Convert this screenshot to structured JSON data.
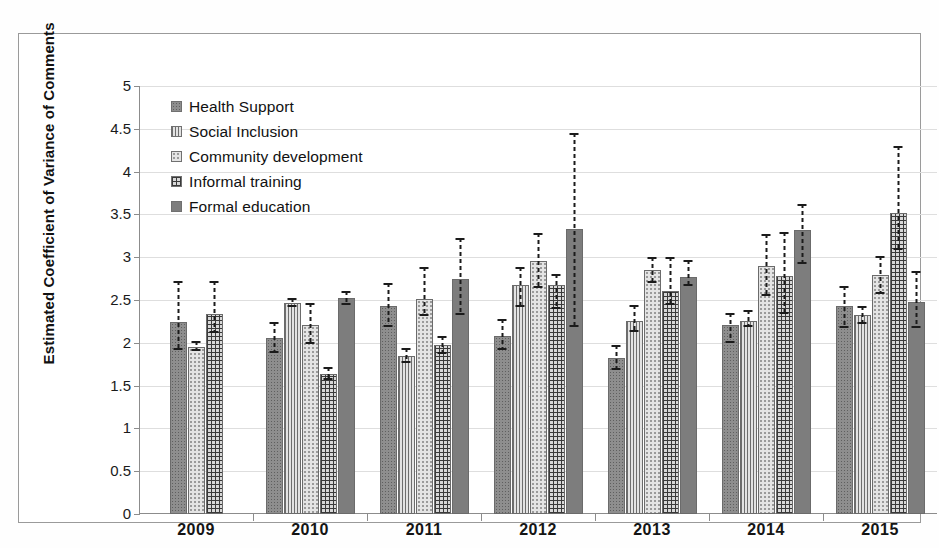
{
  "chart_data": {
    "type": "bar",
    "title": "",
    "xlabel": "",
    "ylabel": "Estimated Coefficient of Variance of Comments",
    "ylim": [
      0,
      5
    ],
    "grid": true,
    "legend_position": "inside-top-left",
    "ytick_labels": [
      "5",
      "4.5",
      "4",
      "3.5",
      "3",
      "2.5",
      "2",
      "1.5",
      "1",
      "0.5",
      "0"
    ],
    "ytick_values": [
      5,
      4.5,
      4,
      3.5,
      3,
      2.5,
      2,
      1.5,
      1,
      0.5,
      0
    ],
    "categories": [
      "2009",
      "2010",
      "2011",
      "2012",
      "2013",
      "2014",
      "2015"
    ],
    "series": [
      {
        "name": "Health Support",
        "pattern": "dark-stipple",
        "values": [
          2.24,
          2.06,
          2.43,
          2.08,
          1.82,
          2.21,
          2.43
        ],
        "err_low": [
          1.92,
          1.88,
          2.18,
          1.92,
          1.68,
          2.0,
          2.17
        ],
        "err_high": [
          2.72,
          2.24,
          2.7,
          2.28,
          1.97,
          2.35,
          2.66
        ]
      },
      {
        "name": "Social Inclusion",
        "pattern": "vertical-lines",
        "values": [
          null,
          2.46,
          1.85,
          2.67,
          2.26,
          2.26,
          2.33
        ],
        "err_low": [
          null,
          2.42,
          1.76,
          2.42,
          2.13,
          2.18,
          2.22
        ],
        "err_high": [
          null,
          2.52,
          1.94,
          2.88,
          2.44,
          2.38,
          2.43
        ]
      },
      {
        "name": "Community development",
        "pattern": "light-dots",
        "values": [
          1.95,
          2.21,
          2.51,
          2.96,
          2.85,
          2.9,
          2.79
        ],
        "err_low": [
          1.9,
          1.99,
          2.31,
          2.64,
          2.7,
          2.55,
          2.57
        ],
        "err_high": [
          2.02,
          2.47,
          2.88,
          3.28,
          3.0,
          3.27,
          3.01
        ]
      },
      {
        "name": "Informal training",
        "pattern": "crosshatch-grid",
        "values": [
          2.34,
          1.63,
          1.97,
          2.67,
          2.61,
          2.78,
          3.52
        ],
        "err_low": [
          2.12,
          1.57,
          1.87,
          2.4,
          2.44,
          2.34,
          3.09
        ],
        "err_high": [
          2.72,
          1.72,
          2.08,
          2.8,
          3.0,
          3.29,
          4.3
        ]
      },
      {
        "name": "Formal education",
        "pattern": "solid-dark",
        "values": [
          null,
          2.52,
          2.75,
          3.33,
          2.77,
          3.32,
          2.48
        ]
      }
    ],
    "series_extra_err": {
      "Formal education": {
        "err_low": [
          null,
          2.44,
          2.32,
          2.18,
          2.66,
          2.92,
          2.17
        ],
        "err_high": [
          null,
          2.6,
          3.22,
          4.45,
          2.97,
          3.62,
          2.84
        ]
      }
    }
  },
  "legend": {
    "items": [
      {
        "label": "Health Support"
      },
      {
        "label": "Social Inclusion"
      },
      {
        "label": "Community development"
      },
      {
        "label": "Informal training"
      },
      {
        "label": "Formal education"
      }
    ]
  },
  "axis": {
    "y_title": "Estimated Coefficient of Variance of Comments"
  }
}
